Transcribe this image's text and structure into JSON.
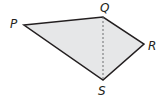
{
  "figure": {
    "type": "quadrilateral",
    "fill_color": "#e6e7e8",
    "stroke_color": "#231f20",
    "vertices": [
      {
        "name": "P",
        "x": 24,
        "y": 25,
        "label_x": 10,
        "label_y": 28
      },
      {
        "name": "Q",
        "x": 103,
        "y": 17,
        "label_x": 100,
        "label_y": 12
      },
      {
        "name": "R",
        "x": 144,
        "y": 44,
        "label_x": 148,
        "label_y": 50
      },
      {
        "name": "S",
        "x": 103,
        "y": 80,
        "label_x": 98,
        "label_y": 95
      }
    ],
    "diagonal": {
      "from": "Q",
      "to": "S",
      "style": "dashed"
    }
  }
}
